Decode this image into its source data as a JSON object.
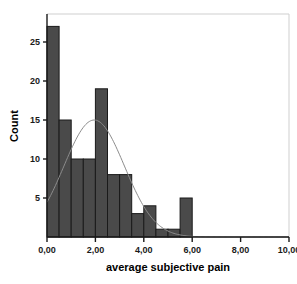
{
  "chart_data": {
    "type": "bar",
    "title": "",
    "xlabel": "average subjective pain",
    "ylabel": "Count",
    "bin_width": 0.5,
    "bin_starts": [
      0.0,
      0.5,
      1.0,
      1.5,
      2.0,
      2.5,
      3.0,
      3.5,
      4.0,
      4.5,
      5.0,
      5.5
    ],
    "categories": [
      "0,0-0,5",
      "0,5-1,0",
      "1,0-1,5",
      "1,5-2,0",
      "2,0-2,5",
      "2,5-3,0",
      "3,0-3,5",
      "3,5-4,0",
      "4,0-4,5",
      "4,5-5,0",
      "5,0-5,5",
      "5,5-6,0"
    ],
    "values": [
      27,
      15,
      10,
      10,
      19,
      8,
      8,
      3,
      4,
      1,
      1,
      5
    ],
    "xlim": [
      0,
      10
    ],
    "ylim": [
      0,
      28
    ],
    "xticks": [
      0,
      2,
      4,
      6,
      8,
      10
    ],
    "xticklabels": [
      "0,00",
      "2,00",
      "4,00",
      "6,00",
      "8,00",
      "10,00"
    ],
    "yticks": [
      5,
      10,
      15,
      20,
      25
    ],
    "yticklabels": [
      "5",
      "10",
      "15",
      "20",
      "25"
    ],
    "grid": false,
    "legend": "none",
    "overlay": {
      "name": "normal-curve",
      "mean": 1.95,
      "sigma": 1.25,
      "peak_count": 15
    },
    "bar_fill_color": "#4a4a4a",
    "bar_edge_color": "#1a1a1a",
    "curve_color": "#8c8c8c",
    "frame_color": "#c8c8c8",
    "axis_color": "#1a1a1a"
  },
  "axes": {
    "x_title": "average subjective pain",
    "y_title": "Count"
  }
}
